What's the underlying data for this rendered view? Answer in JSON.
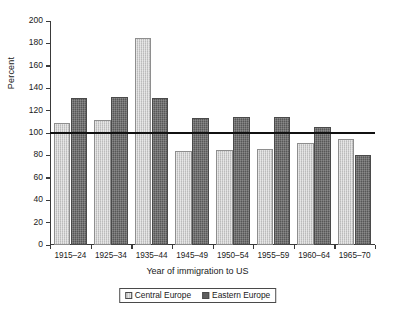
{
  "chart_data": {
    "type": "bar",
    "title": "",
    "subtitle": "",
    "xlabel": "Year of immigration to US",
    "ylabel": "Percent",
    "categories": [
      "1915–24",
      "1925–34",
      "1935–44",
      "1945–49",
      "1950–54",
      "1955–59",
      "1960–64",
      "1965–70"
    ],
    "series": [
      {
        "name": "Central Europe",
        "color": "#c9c9c9",
        "values": [
          109,
          112,
          185,
          84,
          85,
          86,
          91,
          95
        ]
      },
      {
        "name": "Eastern Europe",
        "color": "#6f6f6f",
        "values": [
          131,
          132,
          131,
          113,
          114,
          114,
          105,
          80
        ]
      }
    ],
    "ylim": [
      0,
      200
    ],
    "yticks": [
      0,
      20,
      40,
      60,
      80,
      100,
      120,
      140,
      160,
      180,
      200
    ],
    "ytick_labels": [
      "0",
      "20",
      "40",
      "60",
      "80",
      "100",
      "120",
      "140",
      "160",
      "180",
      "200"
    ],
    "grid": false,
    "reference_line": {
      "value": 100,
      "label": "",
      "color": "#111111"
    },
    "legend": {
      "position": "bottom",
      "entries": [
        "Central Europe",
        "Eastern Europe"
      ]
    }
  }
}
